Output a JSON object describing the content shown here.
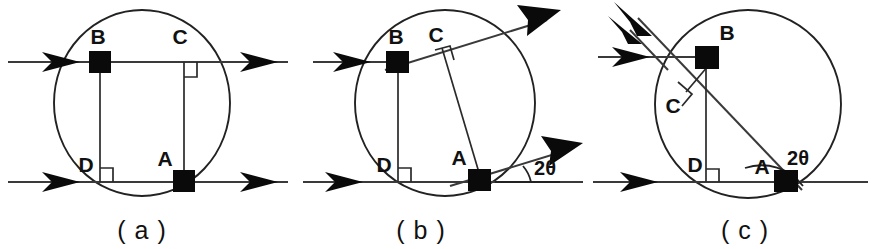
{
  "figure": {
    "background_color": "#ffffff",
    "ink_color": "#111111",
    "panel_count": 3
  },
  "panels": [
    {
      "id": "a",
      "caption": "( a )",
      "description": "Two parallel horizontal rays crossing a circle; chords BD and CA vertical, perpendicular to the lower ray.",
      "points": [
        {
          "name": "A",
          "label": "A",
          "marker": "square"
        },
        {
          "name": "B",
          "label": "B",
          "marker": "square"
        },
        {
          "name": "C",
          "label": "C",
          "marker": "none"
        },
        {
          "name": "D",
          "label": "D",
          "marker": "none"
        }
      ],
      "right_angles": [
        "C",
        "D"
      ],
      "angle_label": "",
      "rays": [
        {
          "name": "upper-ray",
          "direction": "horizontal-right"
        },
        {
          "name": "lower-ray",
          "direction": "horizontal-right"
        }
      ]
    },
    {
      "id": "b",
      "caption": "( b )",
      "description": "Incoming horizontal ray reflects at B; reflected ray tilted by 2theta, second tilted ray through A.",
      "points": [
        {
          "name": "A",
          "label": "A",
          "marker": "square"
        },
        {
          "name": "B",
          "label": "B",
          "marker": "square"
        },
        {
          "name": "C",
          "label": "C",
          "marker": "none"
        },
        {
          "name": "D",
          "label": "D",
          "marker": "none"
        }
      ],
      "right_angles": [
        "C",
        "D"
      ],
      "angle_label": "2θ",
      "rays": [
        {
          "name": "incoming-ray",
          "direction": "horizontal-right"
        },
        {
          "name": "lower-ray",
          "direction": "horizontal-right"
        },
        {
          "name": "reflected-ray-upper",
          "direction": "tilted-up-right"
        },
        {
          "name": "reflected-ray-lower",
          "direction": "tilted-up-right"
        }
      ]
    },
    {
      "id": "c",
      "caption": "( c )",
      "description": "Incoming horizontal ray reflects backwards at B; reflected rays point up-left, angle 2theta marked at A as a reflex-style arc.",
      "points": [
        {
          "name": "A",
          "label": "A",
          "marker": "square"
        },
        {
          "name": "B",
          "label": "B",
          "marker": "square"
        },
        {
          "name": "C",
          "label": "C",
          "marker": "none"
        },
        {
          "name": "D",
          "label": "D",
          "marker": "none"
        }
      ],
      "right_angles": [
        "C",
        "D"
      ],
      "angle_label": "2θ",
      "rays": [
        {
          "name": "incoming-ray",
          "direction": "horizontal-right"
        },
        {
          "name": "lower-ray",
          "direction": "horizontal-right"
        },
        {
          "name": "reflected-ray-upper",
          "direction": "tilted-up-left"
        },
        {
          "name": "reflected-ray-secondary",
          "direction": "tilted-up-left"
        }
      ]
    }
  ],
  "labels": {
    "A": "A",
    "B": "B",
    "C": "C",
    "D": "D",
    "two_theta": "2θ",
    "caption_a": "( a )",
    "caption_b": "( b )",
    "caption_c": "( c )"
  }
}
